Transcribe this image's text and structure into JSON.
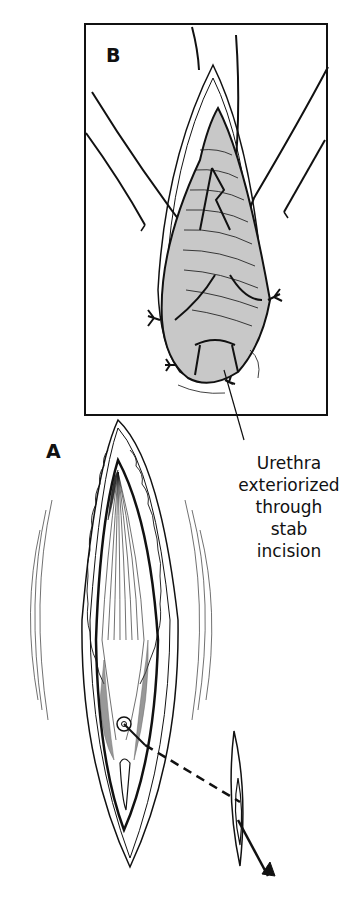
{
  "figure": {
    "panels": [
      {
        "id": "B",
        "label": "B"
      },
      {
        "id": "A",
        "label": "A"
      }
    ],
    "caption": {
      "lines": [
        "Urethra",
        "exteriorized",
        "through",
        "stab",
        "incision"
      ]
    },
    "colors": {
      "ink": "#111111",
      "tissue_fill": "#c8c8c8",
      "background": "#ffffff"
    }
  }
}
